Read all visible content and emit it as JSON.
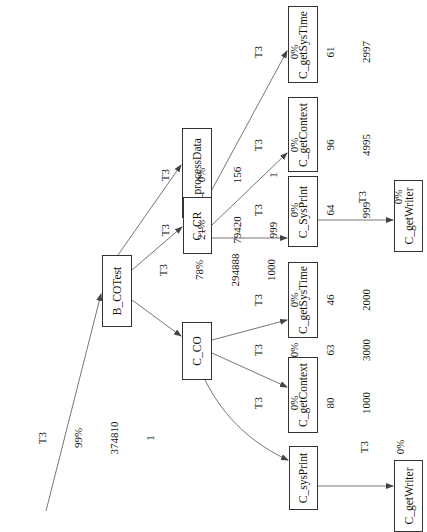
{
  "graph": {
    "type": "call-graph",
    "orientation": "rotated-90-ccw",
    "colors": {
      "edge": "#555555",
      "node_border": "#333333",
      "text": "#111111",
      "background": "#ffffff"
    },
    "nodes": [
      {
        "id": "B_COTest",
        "label": "B_COTest"
      },
      {
        "id": "B_processData",
        "label": "B_processData"
      },
      {
        "id": "C_CR",
        "label": "C_CR"
      },
      {
        "id": "C_CO",
        "label": "C_CO"
      },
      {
        "id": "C_SysPrint",
        "label": "C_SysPrint"
      },
      {
        "id": "C_getContext_CR",
        "label": "C_getContext"
      },
      {
        "id": "C_getSysTime_CR",
        "label": "C_getSysTime"
      },
      {
        "id": "C_getWriter_CR",
        "label": "C_getWriter"
      },
      {
        "id": "C_getSysTime_CO",
        "label": "C_getSysTime"
      },
      {
        "id": "C_getContext_CO",
        "label": "C_getContext"
      },
      {
        "id": "C_sysPrint",
        "label": "C_sysPrint"
      },
      {
        "id": "C_getWriter_CO",
        "label": "C_getWriter"
      }
    ],
    "edges": [
      {
        "from": "root",
        "to": "B_COTest",
        "thread": "T3",
        "percent": "99%",
        "time": "374810",
        "calls": "1"
      },
      {
        "from": "B_COTest",
        "to": "B_processData",
        "thread": "T3",
        "percent": "0%",
        "time": "156",
        "calls": "1"
      },
      {
        "from": "B_COTest",
        "to": "C_CR",
        "thread": "T3",
        "percent": "21%",
        "time": "79420",
        "calls": "999"
      },
      {
        "from": "B_COTest",
        "to": "C_CO",
        "thread": "T3",
        "percent": "78%",
        "time": "294888",
        "calls": "1000"
      },
      {
        "from": "C_CR",
        "to": "C_SysPrint",
        "thread": "T3",
        "percent": "0%",
        "time": "64",
        "calls": "999"
      },
      {
        "from": "C_CR",
        "to": "C_getContext_CR",
        "thread": "T3",
        "percent": "0%",
        "time": "96",
        "calls": "4995"
      },
      {
        "from": "C_CR",
        "to": "C_getSysTime_CR",
        "thread": "T3",
        "percent": "0%",
        "time": "61",
        "calls": "2997"
      },
      {
        "from": "C_SysPrint",
        "to": "C_getWriter_CR",
        "thread": "T3",
        "percent": "0%",
        "time": "16",
        "calls": "999"
      },
      {
        "from": "C_CO",
        "to": "C_getSysTime_CO",
        "thread": "T3",
        "percent": "0%",
        "time": "46",
        "calls": "2000"
      },
      {
        "from": "C_CO",
        "to": "C_getContext_CO",
        "thread": "T3",
        "percent": "0%",
        "time": "63",
        "calls": "3000"
      },
      {
        "from": "C_CO",
        "to": "C_sysPrint",
        "thread": "T3",
        "percent": "0%",
        "time": "80",
        "calls": "1000"
      },
      {
        "from": "C_sysPrint",
        "to": "C_getWriter_CO",
        "thread": "T3",
        "percent": "0%",
        "time": "16",
        "calls": "1000"
      }
    ]
  }
}
